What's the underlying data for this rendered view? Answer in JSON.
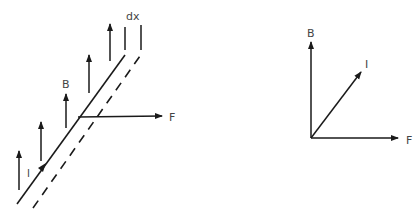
{
  "diagram": {
    "colors": {
      "stroke": "#1a1a1a",
      "label": "#444444",
      "background": "#ffffff"
    },
    "left_figure": {
      "description": "Current-carrying wire segment in upward magnetic field with force F",
      "labels": {
        "dx": "dx",
        "B": "B",
        "F": "F",
        "I": "I"
      },
      "field_arrows_count": 5
    },
    "right_figure": {
      "description": "Vector diagram of B, I and F",
      "labels": {
        "B": "B",
        "I": "I",
        "F": "F"
      }
    }
  }
}
